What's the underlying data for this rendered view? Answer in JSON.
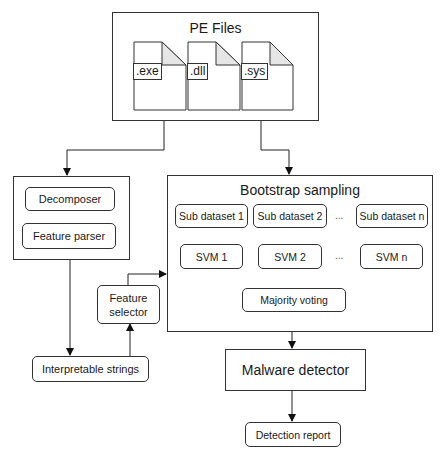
{
  "pe_files": {
    "title": "PE Files",
    "files": [
      {
        "ext": ".exe"
      },
      {
        "ext": ".dll"
      },
      {
        "ext": ".sys"
      }
    ]
  },
  "preprocess": {
    "decomposer": "Decomposer",
    "feature_parser": "Feature parser"
  },
  "feature_selector": "Feature\nselector",
  "feature_selector_lines": [
    "Feature",
    "selector"
  ],
  "interpretable_strings": "Interpretable strings",
  "bootstrap": {
    "title": "Bootstrap sampling",
    "sub_datasets": [
      "Sub dataset 1",
      "Sub dataset 2",
      "Sub dataset n"
    ],
    "svms": [
      "SVM 1",
      "SVM 2",
      "SVM n"
    ],
    "ellipsis": "...",
    "majority_voting": "Majority voting"
  },
  "malware_detector": "Malware detector",
  "detection_report": "Detection report"
}
